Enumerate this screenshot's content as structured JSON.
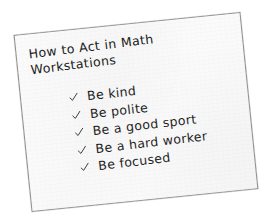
{
  "poster": {
    "title_lines": [
      "How to Act in Math",
      "Workstations"
    ],
    "title_full": "How to Act in Math Workstations",
    "check_icon_name": "checkmark-icon",
    "rules": [
      {
        "text": "Be kind"
      },
      {
        "text": "Be polite"
      },
      {
        "text": "Be a good sport"
      },
      {
        "text": "Be a hard worker"
      },
      {
        "text": "Be focused"
      }
    ],
    "colors": {
      "paper": "#fafafa",
      "border": "#8e8e8e",
      "ink": "#1e1e1e",
      "background": "#ffffff"
    }
  }
}
